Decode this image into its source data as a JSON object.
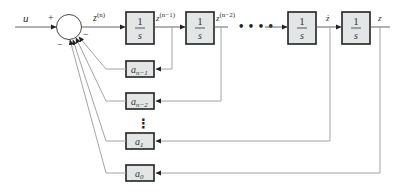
{
  "diagram": {
    "type": "block-diagram",
    "input": {
      "label": "u",
      "sign": "+"
    },
    "summing_junction": {
      "output_label": "z",
      "output_superscript": "(n)",
      "feedback_signs": [
        "−",
        "−"
      ]
    },
    "integrators": [
      {
        "num": "1",
        "den": "s",
        "output_label": "z",
        "output_superscript": "(n−1)"
      },
      {
        "num": "1",
        "den": "s",
        "output_label": "z",
        "output_superscript": "(n−2)"
      },
      {
        "num": "1",
        "den": "s",
        "output_label": "ż",
        "output_superscript": ""
      },
      {
        "num": "1",
        "den": "s",
        "output_label": "z",
        "output_superscript": ""
      }
    ],
    "ellipsis_horizontal": "• • • •",
    "ellipsis_vertical": "⋮",
    "gains": [
      {
        "base": "a",
        "sub": "n−1"
      },
      {
        "base": "a",
        "sub": "n−2"
      },
      {
        "base": "a",
        "sub": "1"
      },
      {
        "base": "a",
        "sub": "0"
      }
    ]
  }
}
